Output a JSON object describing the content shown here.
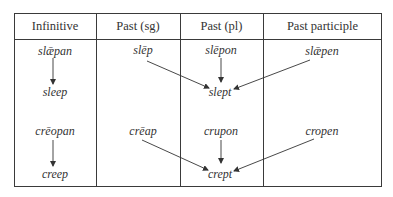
{
  "table": {
    "headers": [
      "Infinitive",
      "Past (sg)",
      "Past (pl)",
      "Past participle"
    ],
    "rows": [
      {
        "infinitive": "slǣpan",
        "infinitive_modern": "sleep",
        "past_sg": "slēp",
        "past_pl": "slēpon",
        "past_modern": "slept",
        "past_participle": "slǣpen"
      },
      {
        "infinitive": "crēopan",
        "infinitive_modern": "creep",
        "past_sg": "crēap",
        "past_pl": "crupon",
        "past_modern": "crept",
        "past_participle": "cropen"
      }
    ]
  },
  "colors": {
    "line": "#3a3a3a",
    "text": "#333333",
    "background": "#ffffff"
  }
}
